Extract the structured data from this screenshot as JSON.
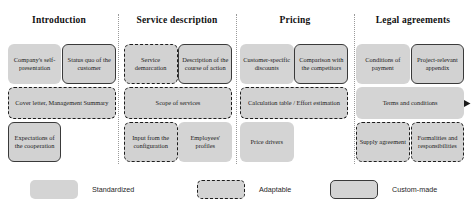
{
  "diagram": {
    "columns": [
      {
        "id": "introduction",
        "label": "Introduction",
        "center_x": 59,
        "divider_x": 118
      },
      {
        "id": "service-description",
        "label": "Service description",
        "center_x": 177,
        "divider_x": 236
      },
      {
        "id": "pricing",
        "label": "Pricing",
        "center_x": 295,
        "divider_x": 354
      },
      {
        "id": "legal-agreements",
        "label": "Legal agreements",
        "center_x": 413,
        "divider_x": null
      }
    ],
    "boxes": [
      {
        "id": "companys-self-presentation",
        "label": "Company's self-presentation",
        "type": "standardized",
        "column": "introduction",
        "row": "top",
        "x": 9,
        "y": 44,
        "w": 63,
        "h": 40
      },
      {
        "id": "status-quo-of-the-customer",
        "label": "Status quo of the customer",
        "type": "custom",
        "column": "introduction",
        "row": "top",
        "x": 73,
        "y": 44,
        "w": 63,
        "h": 40
      },
      {
        "id": "service-demarcation",
        "label": "Service demarcation",
        "type": "adaptable",
        "column": "service-description",
        "row": "top",
        "x": 145,
        "y": 44,
        "w": 63,
        "h": 40
      },
      {
        "id": "description-of-the-course-of-action",
        "label": "Description of the course of action",
        "type": "custom",
        "column": "service-description",
        "row": "top",
        "x": 209,
        "y": 44,
        "w": 63,
        "h": 40
      },
      {
        "id": "customer-specific-discounts",
        "label": "Customer-specific discounts",
        "type": "standardized",
        "column": "pricing",
        "row": "top",
        "x": 281,
        "y": 44,
        "w": 63,
        "h": 40
      },
      {
        "id": "comparison-with-the-competitors",
        "label": "Comparison with the competitors",
        "type": "custom",
        "column": "pricing",
        "row": "top",
        "x": 345,
        "y": 44,
        "w": 63,
        "h": 40
      },
      {
        "id": "conditions-of-payment",
        "label": "Conditions of payment",
        "type": "standardized",
        "column": "legal-agreements",
        "row": "top",
        "x": 417,
        "y": 44,
        "w": 63,
        "h": 40
      },
      {
        "id": "project-relevant-appendix",
        "label": "Project-relevant appendix",
        "type": "custom",
        "column": "legal-agreements",
        "row": "top",
        "x": 481,
        "y": 44,
        "w": 63,
        "h": 40
      },
      {
        "id": "cover-letter-management-summary",
        "label": "Cover letter, Management Summary",
        "type": "adaptable",
        "column": "introduction",
        "row": "middle",
        "x": 9,
        "y": 87,
        "w": 127,
        "h": 32
      },
      {
        "id": "scope-of-services",
        "label": "Scope of services",
        "type": "adaptable",
        "column": "service-description",
        "row": "middle",
        "x": 145,
        "y": 87,
        "w": 127,
        "h": 32
      },
      {
        "id": "calculation-table-effort-estimation",
        "label": "Calculation table / Effort estimation",
        "type": "adaptable",
        "column": "pricing",
        "row": "middle",
        "x": 281,
        "y": 87,
        "w": 127,
        "h": 32
      },
      {
        "id": "terms-and-conditions",
        "label": "Terms and conditions",
        "type": "standardized",
        "column": "legal-agreements",
        "row": "middle",
        "x": 417,
        "y": 87,
        "w": 127,
        "h": 32
      },
      {
        "id": "expectations-of-the-cooperation",
        "label": "Expectations of the cooperation",
        "type": "custom",
        "column": "introduction",
        "row": "bottom",
        "x": 9,
        "y": 122,
        "w": 63,
        "h": 40
      },
      {
        "id": "input-from-the-configuration",
        "label": "Input from the configuration",
        "type": "adaptable",
        "column": "service-description",
        "row": "bottom",
        "x": 145,
        "y": 122,
        "w": 63,
        "h": 40
      },
      {
        "id": "employees-profiles",
        "label": "Employees' profiles",
        "type": "standardized",
        "column": "service-description",
        "row": "bottom",
        "x": 209,
        "y": 122,
        "w": 63,
        "h": 40
      },
      {
        "id": "price-drivers",
        "label": "Price drivers",
        "type": "standardized",
        "column": "pricing",
        "row": "bottom",
        "x": 281,
        "y": 122,
        "w": 63,
        "h": 40
      },
      {
        "id": "supply-agreement",
        "label": "Supply agreement",
        "type": "adaptable",
        "column": "legal-agreements",
        "row": "bottom",
        "x": 417,
        "y": 122,
        "w": 63,
        "h": 40
      },
      {
        "id": "formalities-and-responsibilities",
        "label": "Formalities and responsibilities",
        "type": "adaptable",
        "column": "legal-agreements",
        "row": "bottom",
        "x": 481,
        "y": 122,
        "w": 63,
        "h": 40
      }
    ],
    "legend": [
      {
        "id": "standardized",
        "label": "Standardized",
        "type": "standardized",
        "x": 30,
        "y": 180
      },
      {
        "id": "adaptable",
        "label": "Adaptable",
        "type": "adaptable",
        "x": 197,
        "y": 180
      },
      {
        "id": "custom-made",
        "label": "Custom-made",
        "type": "custom",
        "x": 330,
        "y": 180
      }
    ],
    "colors": {
      "box_fill": "#d2d2d2",
      "box_border_custom": "#3a3a3a",
      "box_border_adaptable": "#1d1d1d",
      "divider": "#9a9a9a",
      "text": "#1c1c1c",
      "background": "#ffffff"
    }
  }
}
